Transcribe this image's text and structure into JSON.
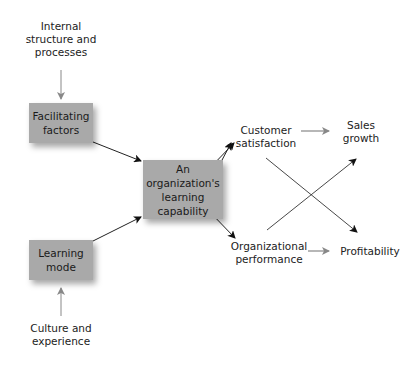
{
  "diagram": {
    "inputs": {
      "top": "Internal\nstructure and\nprocesses",
      "bottom": "Culture and\nexperience"
    },
    "boxes": {
      "facilitating": "Facilitating\nfactors",
      "learning_mode": "Learning\nmode",
      "central": "An organization's\nlearning\ncapability"
    },
    "outcomes": {
      "customer_satisfaction": "Customer\nsatisfaction",
      "organizational_performance": "Organizational\nperformance",
      "sales_growth": "Sales\ngrowth",
      "profitability": "Profitability"
    },
    "colors": {
      "box_fill": "#a9a9a9",
      "arrow_dark": "#222222",
      "arrow_grey": "#888888"
    }
  }
}
